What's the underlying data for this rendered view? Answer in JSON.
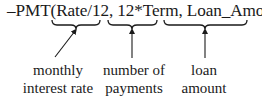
{
  "formula": {
    "text": "–PMT(Rate/12, 12*Term, Loan_Amount)",
    "function_name": "PMT",
    "sign": "–",
    "arguments": [
      "Rate/12",
      "12*Term",
      "Loan_Amount"
    ]
  },
  "annotations": [
    {
      "argument": "Rate/12",
      "line1": "monthly",
      "line2": "interest rate",
      "arrow": "diagonal"
    },
    {
      "argument": "12*Term",
      "line1": "number of",
      "line2": "payments",
      "arrow": "vertical"
    },
    {
      "argument": "Loan_Amount",
      "line1": "loan",
      "line2": "amount",
      "arrow": "vertical"
    }
  ],
  "colors": {
    "ink": "#1a1a1a",
    "background": "#ffffff"
  }
}
